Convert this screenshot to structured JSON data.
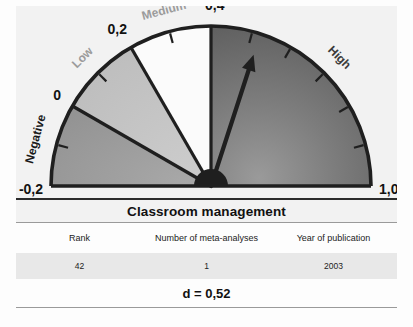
{
  "gauge": {
    "scale_labels": [
      {
        "value": "-0,2",
        "num": -0.2
      },
      {
        "value": "0",
        "num": 0.0
      },
      {
        "value": "0,2",
        "num": 0.2
      },
      {
        "value": "0,4",
        "num": 0.4
      },
      {
        "value": "1,0",
        "num": 1.0
      }
    ],
    "zones": [
      {
        "name": "Negative",
        "from": -0.2,
        "to": 0.0,
        "color": "#9e9e9e",
        "label_color": "#1a1a1a"
      },
      {
        "name": "Low",
        "from": 0.0,
        "to": 0.2,
        "color": "#c4c4c4",
        "label_color": "#9b9b9b"
      },
      {
        "name": "Medium",
        "from": 0.2,
        "to": 0.4,
        "color": "#fbfbfb",
        "label_color": "#9b9b9b"
      },
      {
        "name": "High",
        "from": 0.4,
        "to": 1.0,
        "color": "#6f6f6f",
        "label_color": "#3a3a3a"
      }
    ],
    "needle_value": 0.52,
    "axis_min": -0.2,
    "axis_max": 1.0,
    "tick_step": 0.1
  },
  "table": {
    "title": "Classroom management",
    "headers": [
      "Rank",
      "Number of meta-analyses",
      "Year of publication"
    ],
    "row": [
      "42",
      "1",
      "2003"
    ],
    "effect_size": "d = 0,52"
  },
  "chart_data": {
    "type": "gauge",
    "title": "Classroom management",
    "value": 0.52,
    "value_label": "d = 0,52",
    "axis_min": -0.2,
    "axis_max": 1.0,
    "tick_labels": [
      "-0,2",
      "0",
      "0,2",
      "0,4",
      "1,0"
    ],
    "tick_values": [
      -0.2,
      0.0,
      0.2,
      0.4,
      1.0
    ],
    "minor_tick_step": 0.1,
    "bands": [
      {
        "label": "Negative",
        "min": -0.2,
        "max": 0.0
      },
      {
        "label": "Low",
        "min": 0.0,
        "max": 0.2
      },
      {
        "label": "Medium",
        "min": 0.2,
        "max": 0.4
      },
      {
        "label": "High",
        "min": 0.4,
        "max": 1.0
      }
    ],
    "rank": 42,
    "number_of_meta_analyses": 1,
    "year_of_publication": 2003
  }
}
